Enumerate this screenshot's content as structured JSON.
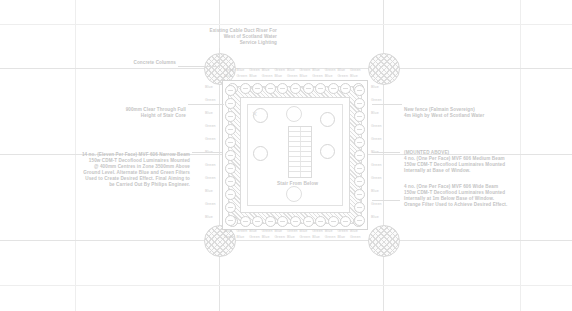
{
  "drawing": {
    "title": "Stair Core Lighting Layout Plan",
    "background_color": "#ffffff",
    "line_color": "#dedede",
    "text_color": "#c4c4c4"
  },
  "notes": {
    "top_center": {
      "name": "existing-cable-duct-riser-note",
      "lines": [
        "Existing Cable Duct Riser For",
        "West of Scotland Water",
        "Service Lighting"
      ]
    },
    "concrete_columns": {
      "name": "concrete-columns-note",
      "lines": [
        "Concrete Columns"
      ]
    },
    "clear_through": {
      "name": "clear-through-height-note",
      "lines": [
        "900mm Clear Through Full",
        "Height of Stair Core"
      ]
    },
    "narrow_beam": {
      "name": "narrow-beam-luminaire-note",
      "lines": [
        "14 no. (Eleven Per Face) MVF 606 Narrow Beam",
        "150w CDM-T Decoflood Luminaires Mounted",
        "@ 400mm Centres in Zone 3500mm Above",
        "Ground Level. Alternate Blue and Green Filters",
        "Used to Create Desired Effect. Final Aiming to",
        "be Carried Out By Philips Engineer."
      ]
    },
    "new_fence": {
      "name": "new-fence-note",
      "lines": [
        "New fence (Falmain Sovereign)",
        "4m High by West of Scotland Water"
      ]
    },
    "medium_beam": {
      "name": "medium-beam-luminaire-note",
      "lines": [
        "(MOUNTED ABOVE)",
        "4 no. (One Per Face) MVF 606 Medium Beam",
        "150w CDM-T Decoflood Luminaires Mounted",
        "Internally at Base of Window."
      ]
    },
    "wide_beam": {
      "name": "wide-beam-luminaire-note",
      "lines": [
        "4 no. (One Per Face) MVF 606 Wide Beam",
        "150w CDM-T Decoflood Luminaires Mounted",
        "Internally at 1m Below Base of Window.",
        "Orange Filter Used to Achieve Desired Effect."
      ]
    },
    "stair_from_below": {
      "name": "stair-from-below-label",
      "text": "Stair From Below"
    }
  },
  "filters": {
    "blue_label": "Blue",
    "green_label": "Green",
    "top_row_upper": [
      "Green",
      "Green",
      "Green",
      "Green",
      "Green"
    ],
    "top_row_lower": [
      "Blue",
      "Blue",
      "Blue",
      "Blue",
      "Blue",
      "Blue"
    ],
    "bottom_row_upper": [
      "Blue",
      "Blue",
      "Blue",
      "Blue",
      "Blue",
      "Blue"
    ],
    "bottom_row_lower": [
      "Green",
      "Green",
      "Green",
      "Green",
      "Green"
    ],
    "left_column": [
      "Blue",
      "Green",
      "Blue",
      "Green",
      "Green",
      "Blue",
      "Green",
      "Green",
      "Blue",
      "Green",
      "Blue"
    ],
    "right_column": [
      "Blue",
      "Green",
      "Blue",
      "Green",
      "Green",
      "Blue",
      "Green",
      "Green",
      "Blue",
      "Green",
      "Blue"
    ]
  },
  "counts": {
    "top_luminaires": 11,
    "bottom_luminaires": 11,
    "left_luminaires": 11,
    "right_luminaires": 11,
    "concrete_columns": 4,
    "corner_luminaires": 4
  },
  "geometry": {
    "core_left": 222,
    "core_top": 80,
    "core_width": 144,
    "core_height": 148,
    "column_diameter": 30
  }
}
